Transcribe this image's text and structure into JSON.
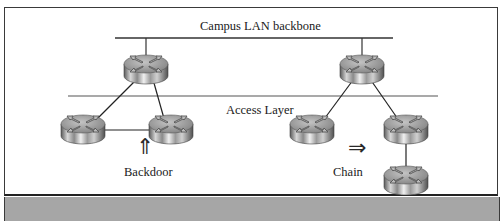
{
  "diagram": {
    "backbone_label": "Campus LAN backbone",
    "access_layer_label": "Access Layer",
    "backdoor_label": "Backdoor",
    "chain_label": "Chain",
    "backdoor_arrow": "⇑",
    "chain_arrow": "⇒",
    "colors": {
      "frame_border": "#3a3a3a",
      "access_line": "#a9a9a9",
      "bottom_band": "#a6a6a6",
      "router_top": "#9c9c9c",
      "router_side": "#b5b5b5"
    },
    "nodes": [
      {
        "id": "left-core-router",
        "x": 146,
        "y": 68
      },
      {
        "id": "left-access-router-1",
        "x": 83,
        "y": 128
      },
      {
        "id": "left-access-router-2",
        "x": 171,
        "y": 128
      },
      {
        "id": "right-core-router",
        "x": 362,
        "y": 68
      },
      {
        "id": "right-access-router-1",
        "x": 312,
        "y": 128
      },
      {
        "id": "right-access-router-2",
        "x": 406,
        "y": 128
      },
      {
        "id": "right-chain-router",
        "x": 406,
        "y": 179
      }
    ],
    "links": [
      [
        "left-core-router",
        "left-access-router-1"
      ],
      [
        "left-core-router",
        "left-access-router-2"
      ],
      [
        "left-access-router-1",
        "left-access-router-2"
      ],
      [
        "right-core-router",
        "right-access-router-1"
      ],
      [
        "right-core-router",
        "right-access-router-2"
      ],
      [
        "right-access-router-2",
        "right-chain-router"
      ]
    ]
  }
}
